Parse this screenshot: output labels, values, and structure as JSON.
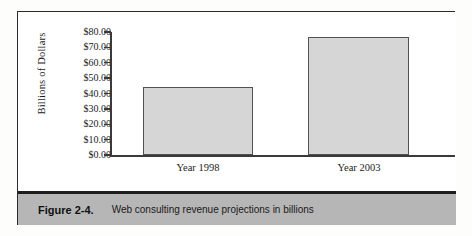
{
  "figure": {
    "caption_number": "Figure 2-4.",
    "caption_text": "Web consulting revenue projections in billions"
  },
  "colors": {
    "bar_fill": "#d6d6d6",
    "bar_border": "#515151",
    "axis": "#3a3a3a",
    "caption_band": "#b6b6b6",
    "frame": "#2b2b2b"
  },
  "chart_data": {
    "type": "bar",
    "title": "",
    "xlabel": "",
    "ylabel": "Billions of Dollars",
    "categories": [
      "Year 1998",
      "Year 2003"
    ],
    "values": [
      44,
      77
    ],
    "ylim": [
      0,
      80
    ],
    "ytick_values": [
      0,
      10,
      20,
      30,
      40,
      50,
      60,
      70,
      80
    ],
    "ytick_labels": [
      "$0.00",
      "$10.00",
      "$20.00",
      "$30.00",
      "$40.00",
      "$50.00",
      "$60.00",
      "$70.00",
      "$80.00"
    ],
    "grid": false,
    "legend": false
  }
}
